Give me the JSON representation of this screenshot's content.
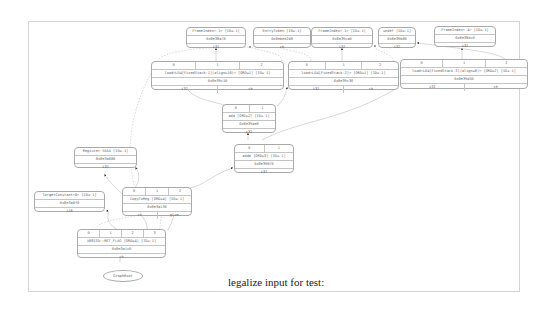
{
  "caption": "legalize input for test:",
  "nodes": {
    "frameindex_a": {
      "title": "FrameIndex<-1> [ID=-1]",
      "addr": "0x8e38a70",
      "type": "i32"
    },
    "entrytoken": {
      "title": "EntryToken [ID=-1]",
      "addr": "0x8ebee2d8",
      "type": "ch"
    },
    "frameindex_b": {
      "title": "FrameIndex<-1> [ID=-1]",
      "addr": "0x8e39ca0",
      "type": "i32"
    },
    "undef": {
      "title": "undef [ID=-1]",
      "addr": "0x8e39b88",
      "type": "i32"
    },
    "frameindex_c": {
      "title": "FrameIndex<-4> [ID=-1]",
      "addr": "0x8e38dc0",
      "type": "i32"
    },
    "load_a": {
      "ports": [
        "0",
        "1",
        "2"
      ],
      "title": "load<LD4[FixedStack-1](align=16)> [ORD=1] [ID=-1]",
      "addr": "0x8e39c10",
      "outs": [
        "i32",
        "ch"
      ]
    },
    "load_b": {
      "ports": [
        "0",
        "1",
        "2"
      ],
      "title": "load<LD4[FixedStack-2]> [ORD=1] [ID=-1]",
      "addr": "0x8e39c30",
      "outs": [
        "i32",
        "ch"
      ]
    },
    "load_c": {
      "ports": [
        "0",
        "1",
        "2"
      ],
      "title": "load<LD4[FixedStack-3](align=8)> [ORD=2] [ID=-1]",
      "addr": "0x8e39d50",
      "outs": [
        "i32",
        "ch"
      ]
    },
    "add": {
      "ports": [
        "0",
        "1"
      ],
      "title": "add [ORD=2] [ID=-1]",
      "addr": "0x8e39ae8",
      "type": "i32"
    },
    "adde": {
      "ports": [
        "0",
        "1"
      ],
      "title": "adde [ORD=3] [ID=-1]",
      "addr": "0x8e39870",
      "type": "i32"
    },
    "register": {
      "title": "Register %EAX [ID=-1]",
      "addr": "0x8e3a080",
      "type": "i32"
    },
    "targetconstant": {
      "title": "TargetConstant<0> [ID=-1]",
      "addr": "0x8e3a0f0",
      "type": "i16"
    },
    "copytoreg": {
      "ports": [
        "0",
        "1",
        "2"
      ],
      "title": "CopyToReg [ORD=4] [ID=-1]",
      "addr": "0x8e3a130",
      "outs": [
        "ch",
        "glue"
      ]
    },
    "x86isd": {
      "ports": [
        "0",
        "1",
        "2",
        "3"
      ],
      "title": "X86ISD::RET_FLAG [ORD=4] [ID=-1]",
      "addr": "0x8e3a1c0",
      "type": "ch"
    },
    "graphroot": {
      "label": "GraphRoot"
    }
  }
}
